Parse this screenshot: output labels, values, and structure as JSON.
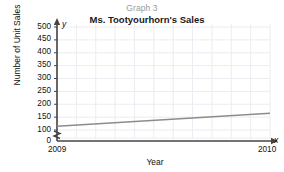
{
  "chart_data": {
    "type": "line",
    "title": "Ms. Tootyourhorn's Sales",
    "supertitle": "Graph 3",
    "xlabel": "Year",
    "ylabel": "Number of Unit Sales",
    "x": [
      "2009",
      "2010"
    ],
    "xtick_labels": [
      "2009",
      "2010"
    ],
    "ytick_labels": [
      "500",
      "450",
      "400",
      "350",
      "300",
      "250",
      "200",
      "150",
      "100",
      "0"
    ],
    "ytick_values": [
      500,
      450,
      400,
      350,
      300,
      250,
      200,
      150,
      100,
      0
    ],
    "ylim": [
      100,
      500
    ],
    "y_axis_broken": true,
    "y_break_label": "0",
    "grid": true,
    "legend": null,
    "series": [
      {
        "name": "Unit Sales",
        "values": [
          115,
          165
        ],
        "color": "#8c8c8c"
      }
    ],
    "axis_arrow_labels": {
      "x": "x",
      "y": "y"
    }
  },
  "colors": {
    "line": "#8c8c8c",
    "axis": "#444444",
    "grid": "#ececf2",
    "text": "#111111",
    "supertitle": "#9a9a9a",
    "background": "#ffffff"
  }
}
